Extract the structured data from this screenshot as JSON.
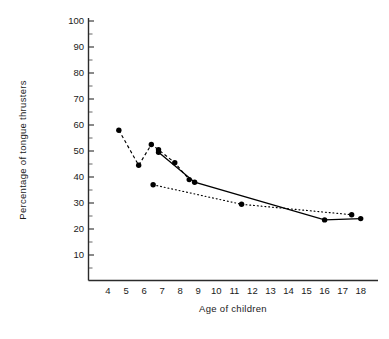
{
  "chart_data": {
    "type": "line",
    "title": "",
    "xlabel": "Age of children",
    "ylabel": "Percentage of tongue thrusters",
    "xlim": [
      3.4,
      18.8
    ],
    "ylim": [
      5,
      103
    ],
    "grid": false,
    "legend": "none",
    "x_ticks": [
      4,
      5,
      6,
      7,
      8,
      9,
      10,
      11,
      12,
      13,
      14,
      15,
      16,
      17,
      18
    ],
    "x_tick_labels": [
      "4",
      "5",
      "6",
      "7",
      "8",
      "9",
      "10",
      "11",
      "12",
      "13",
      "14",
      "15",
      "16",
      "17",
      "18"
    ],
    "y_ticks": [
      10,
      20,
      30,
      40,
      50,
      60,
      70,
      80,
      90,
      100
    ],
    "y_tick_labels": [
      "10",
      "20",
      "30",
      "40",
      "50",
      "60",
      "70",
      "80",
      "90",
      "100"
    ],
    "y_minor_ticks": [
      5,
      15,
      25,
      35,
      45,
      55,
      65,
      75,
      85,
      95
    ],
    "series": [
      {
        "name": "dashed-series",
        "style": "dashed",
        "color": "#000000",
        "marker": "filled-circle",
        "points": [
          {
            "x": 4.6,
            "y": 58.0
          },
          {
            "x": 5.7,
            "y": 44.5
          },
          {
            "x": 6.4,
            "y": 52.5
          },
          {
            "x": 6.8,
            "y": 50.5
          },
          {
            "x": 7.7,
            "y": 45.5
          },
          {
            "x": 8.5,
            "y": 39.0
          }
        ]
      },
      {
        "name": "solid-series",
        "style": "solid",
        "color": "#000000",
        "marker": "filled-circle",
        "points": [
          {
            "x": 6.8,
            "y": 49.5
          },
          {
            "x": 8.8,
            "y": 38.0
          },
          {
            "x": 16.0,
            "y": 23.5
          },
          {
            "x": 18.0,
            "y": 24.0
          }
        ]
      },
      {
        "name": "dotted-series",
        "style": "dotted",
        "color": "#000000",
        "marker": "filled-circle",
        "points": [
          {
            "x": 6.5,
            "y": 37.0
          },
          {
            "x": 11.4,
            "y": 29.5
          },
          {
            "x": 17.5,
            "y": 25.5
          }
        ]
      }
    ]
  },
  "axes": {
    "x_title": "Age of children",
    "y_title": "Percentage of tongue thrusters"
  }
}
